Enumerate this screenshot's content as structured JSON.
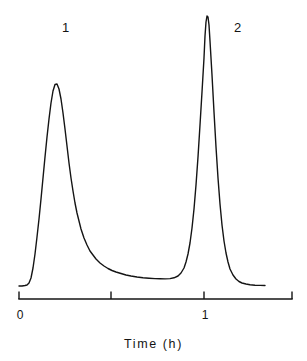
{
  "chart_data": {
    "type": "line",
    "title": "",
    "subtitle": "",
    "xlabel": "Time  (h)",
    "ylabel": "",
    "xlim": [
      -0.205,
      2.935
    ],
    "ylim": [
      0,
      1.0
    ],
    "grid": false,
    "legend_position": "none",
    "axis": {
      "line_color": "#141414",
      "tick_direction": "up",
      "ticks": [
        {
          "value": 0,
          "label": "0",
          "x_px": 19
        },
        {
          "value": 1,
          "label": "",
          "x_px": 111
        },
        {
          "value": 2,
          "label": "1",
          "x_px": 204
        },
        {
          "value": 3,
          "label": "",
          "x_px": 292
        }
      ],
      "tick_unit_note": "major divisions; labelled 0 and 1 h"
    },
    "annotations": [
      {
        "text": "1",
        "x_px": 66,
        "y_px": 27,
        "refers_to": "peak-1"
      },
      {
        "text": "2",
        "x_px": 238,
        "y_px": 27,
        "refers_to": "peak-2"
      }
    ],
    "series": [
      {
        "name": "detector-signal",
        "color": "#141414",
        "line_width": 1.4,
        "peaks": [
          {
            "id": 1,
            "label": "1",
            "apex_time_h": 0.39,
            "apex_height": 0.79,
            "shape": "tailing"
          },
          {
            "id": 2,
            "label": "2",
            "apex_time_h": 1.03,
            "apex_height": 1.0,
            "shape": "sharp"
          }
        ],
        "baseline_height": 0.0,
        "valley_between_peaks": {
          "time_h": 0.79,
          "height": 0.035
        },
        "points_px": [
          [
            19,
            286
          ],
          [
            22,
            286
          ],
          [
            25,
            285.5
          ],
          [
            27,
            285
          ],
          [
            29,
            283
          ],
          [
            31,
            278
          ],
          [
            33,
            268
          ],
          [
            35,
            254
          ],
          [
            37,
            237
          ],
          [
            39,
            219
          ],
          [
            41,
            199
          ],
          [
            43,
            178
          ],
          [
            45,
            157
          ],
          [
            47,
            137
          ],
          [
            49,
            119
          ],
          [
            51,
            103
          ],
          [
            53,
            91
          ],
          [
            55,
            84.5
          ],
          [
            57,
            84
          ],
          [
            59,
            89
          ],
          [
            61,
            99
          ],
          [
            63,
            113
          ],
          [
            65,
            129
          ],
          [
            67,
            146
          ],
          [
            69,
            163
          ],
          [
            71,
            178
          ],
          [
            73,
            191
          ],
          [
            75,
            203
          ],
          [
            77,
            213
          ],
          [
            79,
            221
          ],
          [
            81,
            229
          ],
          [
            84,
            238
          ],
          [
            87,
            245
          ],
          [
            90,
            251
          ],
          [
            93,
            255
          ],
          [
            96,
            259
          ],
          [
            100,
            263
          ],
          [
            104,
            266
          ],
          [
            108,
            268.5
          ],
          [
            112,
            270.5
          ],
          [
            116,
            272
          ],
          [
            121,
            273.5
          ],
          [
            126,
            275
          ],
          [
            131,
            276
          ],
          [
            137,
            277
          ],
          [
            143,
            277.7
          ],
          [
            149,
            278.2
          ],
          [
            155,
            278.6
          ],
          [
            160,
            278.8
          ],
          [
            165,
            278.9
          ],
          [
            170,
            278.6
          ],
          [
            174,
            277.8
          ],
          [
            178,
            276
          ],
          [
            181,
            273
          ],
          [
            184,
            268
          ],
          [
            186,
            262
          ],
          [
            188,
            254
          ],
          [
            190,
            243
          ],
          [
            192,
            228
          ],
          [
            194,
            209
          ],
          [
            196,
            185
          ],
          [
            198,
            157
          ],
          [
            200,
            125
          ],
          [
            202,
            92
          ],
          [
            204,
            58
          ],
          [
            205,
            36
          ],
          [
            206,
            22
          ],
          [
            207,
            16
          ],
          [
            208,
            17
          ],
          [
            209,
            25
          ],
          [
            210,
            41
          ],
          [
            212,
            75
          ],
          [
            214,
            112
          ],
          [
            216,
            147
          ],
          [
            218,
            178
          ],
          [
            220,
            204
          ],
          [
            222,
            225
          ],
          [
            224,
            241
          ],
          [
            226,
            253
          ],
          [
            228,
            262
          ],
          [
            230,
            269
          ],
          [
            233,
            275
          ],
          [
            236,
            279
          ],
          [
            239,
            281.5
          ],
          [
            242,
            283
          ],
          [
            246,
            284
          ],
          [
            250,
            284.8
          ],
          [
            255,
            285.2
          ],
          [
            260,
            285.4
          ],
          [
            265,
            285.5
          ]
        ]
      }
    ]
  },
  "figure": {
    "background_color": "#ffffff",
    "ink_color": "#141414",
    "peak_labels": {
      "first": "1",
      "second": "2"
    },
    "tick_labels": {
      "zero": "0",
      "one": "1"
    },
    "axis_title": "Time  (h)"
  }
}
